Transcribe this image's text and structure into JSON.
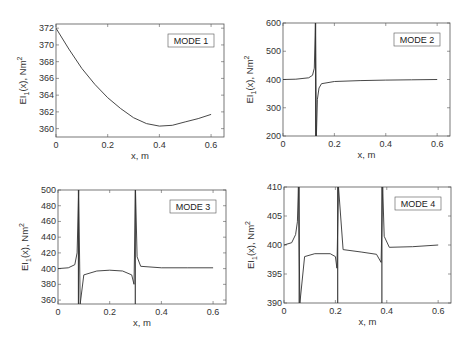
{
  "chart_data": [
    {
      "type": "line",
      "title": "",
      "legend": "MODE 1",
      "xlabel": "x, m",
      "ylabel": "EI1(x), Nm2",
      "xlim": [
        0,
        0.65
      ],
      "ylim": [
        359,
        372.5
      ],
      "xticks": [
        "0",
        "0.2",
        "0.4",
        "0.6"
      ],
      "yticks": [
        "360",
        "362",
        "364",
        "366",
        "368",
        "370",
        "372"
      ],
      "box": {
        "x": 56,
        "y": 24,
        "w": 168,
        "h": 113
      },
      "series": [
        {
          "name": "MODE 1",
          "x": [
            0,
            0.05,
            0.1,
            0.15,
            0.2,
            0.25,
            0.3,
            0.35,
            0.4,
            0.45,
            0.5,
            0.55,
            0.6
          ],
          "y": [
            372,
            369.5,
            367.2,
            365.3,
            363.7,
            362.4,
            361.3,
            360.6,
            360.3,
            360.4,
            360.8,
            361.2,
            361.7
          ]
        }
      ],
      "asymptotes": []
    },
    {
      "type": "line",
      "title": "",
      "legend": "MODE 2",
      "xlabel": "x, m",
      "ylabel": "EI1(x), Nm2",
      "xlim": [
        0,
        0.65
      ],
      "ylim": [
        200,
        600
      ],
      "xticks": [
        "0",
        "0.2",
        "0.4",
        "0.6"
      ],
      "yticks": [
        "200",
        "300",
        "400",
        "500",
        "600"
      ],
      "box": {
        "x": 283,
        "y": 23,
        "w": 167,
        "h": 113
      },
      "series": [
        {
          "name": "MODE 2",
          "x": [
            0,
            0.05,
            0.1,
            0.115,
            0.122,
            0.126,
            0.13,
            0.134,
            0.14,
            0.15,
            0.2,
            0.3,
            0.4,
            0.5,
            0.6
          ],
          "y": [
            400,
            401,
            406,
            415,
            440,
            600,
            200,
            330,
            370,
            385,
            393,
            396,
            398,
            399,
            400
          ]
        }
      ],
      "asymptotes": [
        0.127
      ]
    },
    {
      "type": "line",
      "title": "",
      "legend": "MODE 3",
      "xlabel": "x, m",
      "ylabel": "EI1(x), Nm2",
      "xlim": [
        0,
        0.65
      ],
      "ylim": [
        355,
        500
      ],
      "xticks": [
        "0",
        "0.2",
        "0.4",
        "0.6"
      ],
      "yticks": [
        "360",
        "380",
        "400",
        "420",
        "440",
        "460",
        "480",
        "500"
      ],
      "box": {
        "x": 58,
        "y": 190,
        "w": 168,
        "h": 114
      },
      "series": [
        {
          "name": "MODE 3",
          "x": [
            0,
            0.04,
            0.065,
            0.074,
            0.08,
            0.086,
            0.1,
            0.15,
            0.2,
            0.25,
            0.285,
            0.294,
            0.3,
            0.306,
            0.32,
            0.4,
            0.5,
            0.6
          ],
          "y": [
            400,
            401,
            405,
            420,
            500,
            355,
            392,
            397,
            398,
            397,
            392,
            380,
            500,
            415,
            403,
            401,
            401,
            401
          ]
        }
      ],
      "asymptotes": [
        0.079,
        0.299
      ]
    },
    {
      "type": "line",
      "title": "",
      "legend": "MODE 4",
      "xlabel": "x, m",
      "ylabel": "EI1(x), Nm2",
      "xlim": [
        0,
        0.65
      ],
      "ylim": [
        390,
        410
      ],
      "xticks": [
        "0",
        "0.2",
        "0.4",
        "0.6"
      ],
      "yticks": [
        "390",
        "395",
        "400",
        "405",
        "410"
      ],
      "box": {
        "x": 284,
        "y": 187,
        "w": 167,
        "h": 116
      },
      "series": [
        {
          "name": "MODE 4",
          "x": [
            0,
            0.03,
            0.045,
            0.052,
            0.056,
            0.062,
            0.08,
            0.12,
            0.18,
            0.2,
            0.206,
            0.212,
            0.23,
            0.3,
            0.36,
            0.378,
            0.384,
            0.39,
            0.41,
            0.5,
            0.6
          ],
          "y": [
            400,
            400.4,
            401.8,
            404,
            410,
            390,
            398,
            398.5,
            398.5,
            398,
            396,
            410,
            399.2,
            398.8,
            398.4,
            397,
            410,
            401.5,
            399.6,
            399.7,
            400
          ]
        }
      ],
      "asymptotes": [
        0.059,
        0.209,
        0.381
      ]
    }
  ]
}
